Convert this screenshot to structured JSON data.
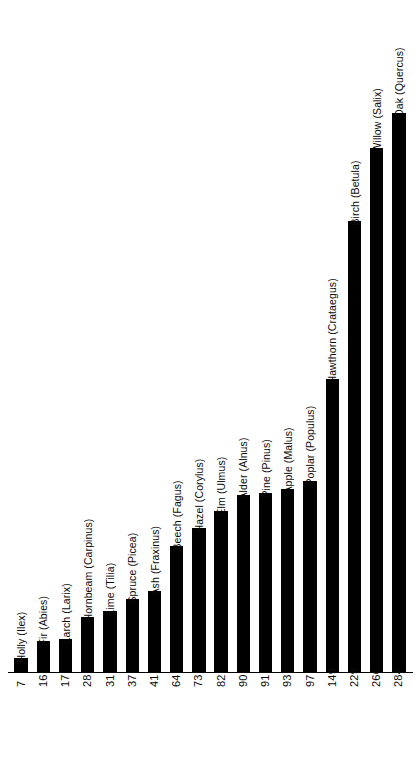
{
  "chart_data": {
    "type": "bar",
    "title": "",
    "subtitle": "",
    "xlabel": "",
    "ylabel": "",
    "orientation": "vertical",
    "grid": false,
    "legend": null,
    "axis_ranges": {
      "value_min": 0,
      "value_max": 284
    },
    "categories": [
      "Holly (Ilex)",
      "Fir (Abies)",
      "Larch (Larix)",
      "Hornbeam (Carpinus)",
      "Lime (Tilia)",
      "Spruce (Picea)",
      "Ash (Fraxinus)",
      "Beech (Fagus)",
      "Hazel (Corylus)",
      "Elm (Ulmus)",
      "Alder (Alnus)",
      "Pine (Pinus)",
      "Apple (Malus)",
      "Poplar (Populus)",
      "Hawthorn (Crataegus)",
      "Birch (Betula)",
      "Willow (Salix)",
      "Oak (Quercus)"
    ],
    "values": [
      7,
      16,
      17,
      28,
      31,
      37,
      41,
      64,
      73,
      82,
      90,
      91,
      93,
      97,
      149,
      229,
      266,
      284
    ],
    "value_labels": [
      "7",
      "16",
      "17",
      "28",
      "31",
      "37",
      "41",
      "64",
      "73",
      "82",
      "90",
      "91",
      "93",
      "97",
      "149",
      "229",
      "266",
      "284"
    ],
    "colors": {
      "bar_fill": "#000000",
      "axis_line": "#000000",
      "background": "#ffffff",
      "text": "#0a0a0a"
    }
  }
}
